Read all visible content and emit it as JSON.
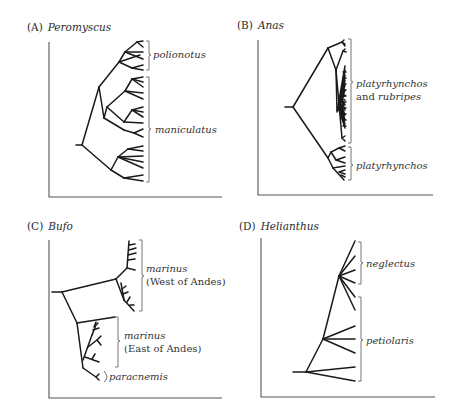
{
  "figure": {
    "panels": [
      {
        "id": "A",
        "letter": "(A)",
        "genus": "Peromyscus",
        "clades": [
          {
            "label": "polionotus"
          },
          {
            "label": "maniculatus"
          }
        ]
      },
      {
        "id": "B",
        "letter": "(B)",
        "genus": "Anas",
        "clades": [
          {
            "label_line1": "platyrhynchos",
            "label_line2_plain": "and ",
            "label_line2_italic": "rubripes"
          },
          {
            "label": "platyrhynchos"
          }
        ]
      },
      {
        "id": "C",
        "letter": "(C)",
        "genus": "Bufo",
        "clades": [
          {
            "label_line1": "marinus",
            "label_line2": "(West of Andes)"
          },
          {
            "label_line1": "marinus",
            "label_line2": "(East of Andes)"
          },
          {
            "label": "paracnemis"
          }
        ]
      },
      {
        "id": "D",
        "letter": "(D)",
        "genus": "Helianthus",
        "clades": [
          {
            "label": "neglectus"
          },
          {
            "label": "petiolaris"
          }
        ]
      }
    ],
    "colors": {
      "branch": "#1a1a1a",
      "axis": "#555555",
      "text": "#2a2a2a"
    }
  }
}
